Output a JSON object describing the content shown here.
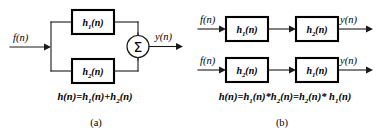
{
  "figure": {
    "background_color": "#ffffff",
    "line_color": "#1a1a1a",
    "text_color": "#000000"
  },
  "panel_a": {
    "caption": "(a)",
    "input_label": "f(n)",
    "output_label": "y(n)",
    "sum_symbol": "Σ",
    "blocks": [
      {
        "name": "h",
        "sub": "1",
        "suffix": "(n)",
        "position": "top"
      },
      {
        "name": "h",
        "sub": "2",
        "suffix": "(n)",
        "position": "bottom"
      }
    ],
    "equation": {
      "lhs": "h(n)=",
      "term1": {
        "name": "h",
        "sub": "1",
        "suffix": "(n)"
      },
      "op1": "+",
      "term2": {
        "name": "h",
        "sub": "2",
        "suffix": "(n)"
      }
    }
  },
  "panel_b": {
    "caption": "(b)",
    "rows": [
      {
        "input_label": "f(n)",
        "output_label": "y(n)",
        "block1": {
          "name": "h",
          "sub": "1",
          "suffix": "(n)"
        },
        "block2": {
          "name": "h",
          "sub": "2",
          "suffix": "(n)"
        }
      },
      {
        "input_label": "f(n)",
        "output_label": "y(n)",
        "block1": {
          "name": "h",
          "sub": "2",
          "suffix": "(n)"
        },
        "block2": {
          "name": "h",
          "sub": "1",
          "suffix": "(n)"
        }
      }
    ],
    "equation": {
      "lhs": "h(n)=",
      "term1": {
        "name": "h",
        "sub": "1",
        "suffix": "(n)"
      },
      "op1": "*",
      "term2": {
        "name": "h",
        "sub": "2",
        "suffix": "(n)"
      },
      "op2": "=",
      "term3": {
        "name": "h",
        "sub": "2",
        "suffix": "(n)"
      },
      "op3": "*",
      "term4": {
        "name": "h",
        "sub": "1",
        "suffix": "(n)"
      }
    }
  }
}
